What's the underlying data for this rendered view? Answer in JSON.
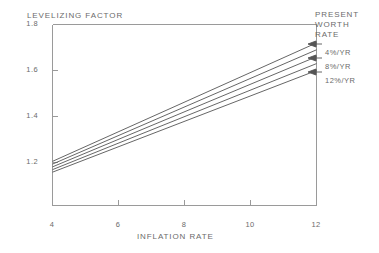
{
  "chart_data": {
    "type": "line",
    "title": "",
    "xlabel": "INFLATION RATE",
    "ylabel": "LEVELIZING FACTOR",
    "xlim": [
      4,
      12
    ],
    "ylim": [
      1.0,
      1.8
    ],
    "xticks": [
      "4",
      "6",
      "8",
      "10",
      "12"
    ],
    "xtick_values": [
      4,
      6,
      8,
      10,
      12
    ],
    "yticks": [
      "1.2",
      "1.4",
      "1.6",
      "1.8"
    ],
    "ytick_values": [
      1.2,
      1.4,
      1.6,
      1.8
    ],
    "grid": false,
    "legend_position": "right",
    "legend_title": "PRESENT WORTH RATE",
    "x": [
      4,
      12
    ],
    "series": [
      {
        "name": "4%/YR",
        "values": [
          1.205,
          1.72
        ],
        "labeled": true
      },
      {
        "name": "6%/YR",
        "values": [
          1.193,
          1.69
        ],
        "labeled": false
      },
      {
        "name": "8%/YR",
        "values": [
          1.181,
          1.66
        ],
        "labeled": true
      },
      {
        "name": "10%/YR",
        "values": [
          1.169,
          1.63
        ],
        "labeled": false
      },
      {
        "name": "12%/YR",
        "values": [
          1.158,
          1.6
        ],
        "labeled": true
      }
    ],
    "colors": {
      "line": "#555555",
      "axis": "#999999",
      "text": "#6b6b6b"
    }
  },
  "legend": {
    "heading_lines": [
      "PRESENT",
      "WORTH",
      "RATE"
    ],
    "entries": [
      {
        "label": "4%/YR"
      },
      {
        "label": "8%/YR"
      },
      {
        "label": "12%/YR"
      }
    ]
  }
}
